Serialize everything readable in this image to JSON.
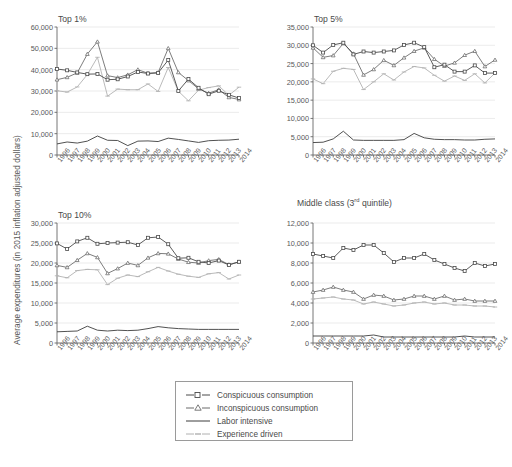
{
  "figure": {
    "ylabel": "Average expenditures (in 2015 inflation adjusted dollars)",
    "background": "#ffffff",
    "axis_color": "#666666",
    "grid_color": "#e3e3e3"
  },
  "legend": {
    "position": "bottom-center",
    "items": [
      {
        "label": "Conspicuous consumption",
        "marker": "square",
        "color": "#4a4a4a"
      },
      {
        "label": "Inconspicuous consumption",
        "marker": "triangle",
        "color": "#6b6b6b"
      },
      {
        "label": "Labor intensive",
        "marker": "line",
        "color": "#3d3d3d"
      },
      {
        "label": "Experience driven",
        "marker": "dot",
        "color": "#b0b0b0"
      }
    ]
  },
  "chart_data": [
    {
      "type": "line",
      "title": "Top 1%",
      "xlabel": "",
      "ylabel": "Average expenditures (in 2015 inflation adjusted dollars)",
      "x": [
        1996,
        1997,
        1998,
        1999,
        2000,
        2001,
        2002,
        2003,
        2004,
        2005,
        2006,
        2007,
        2008,
        2009,
        2010,
        2011,
        2012,
        2013,
        2014
      ],
      "ylim": [
        0,
        60000
      ],
      "yticks": [
        "0",
        "10,000",
        "20,000",
        "30,000",
        "40,000",
        "50,000",
        "60,000"
      ],
      "grid": true,
      "series": [
        {
          "name": "Conspicuous consumption",
          "marker": "square",
          "values": [
            40300,
            39700,
            38700,
            37900,
            38000,
            35300,
            35500,
            36800,
            38900,
            38200,
            38500,
            44500,
            30000,
            35600,
            31500,
            28500,
            30100,
            28200,
            26700
          ]
        },
        {
          "name": "Inconspicuous consumption",
          "marker": "triangle",
          "values": [
            35300,
            36400,
            38500,
            47300,
            53100,
            37200,
            36300,
            37600,
            40000,
            38300,
            38600,
            50000,
            38700,
            34900,
            31000,
            29000,
            30600,
            27000,
            26000
          ]
        },
        {
          "name": "Labor intensive",
          "marker": "line",
          "values": [
            5200,
            6100,
            5600,
            6500,
            8900,
            6900,
            6800,
            4400,
            6500,
            6600,
            6300,
            7900,
            7300,
            6600,
            5900,
            6700,
            6900,
            7000,
            7400
          ]
        },
        {
          "name": "Experience driven",
          "marker": "dot",
          "values": [
            30100,
            29500,
            31900,
            37700,
            45800,
            27600,
            30900,
            30600,
            30600,
            33300,
            29800,
            41000,
            29900,
            25400,
            30400,
            31600,
            32400,
            28000,
            31800
          ]
        }
      ]
    },
    {
      "type": "line",
      "title": "Top 5%",
      "xlabel": "",
      "ylabel": "Average expenditures (in 2015 inflation adjusted dollars)",
      "x": [
        1996,
        1997,
        1998,
        1999,
        2000,
        2001,
        2002,
        2003,
        2004,
        2005,
        2006,
        2007,
        2008,
        2009,
        2010,
        2011,
        2012,
        2013,
        2014
      ],
      "ylim": [
        0,
        35000
      ],
      "yticks": [
        "0",
        "5,000",
        "10,000",
        "15,000",
        "20,000",
        "25,000",
        "30,000",
        "35,000"
      ],
      "grid": true,
      "series": [
        {
          "name": "Conspicuous consumption",
          "marker": "square",
          "values": [
            30000,
            28000,
            30100,
            30700,
            27500,
            28300,
            28000,
            28300,
            28600,
            30100,
            30700,
            29500,
            24000,
            24700,
            22800,
            22800,
            24500,
            22400,
            22400
          ]
        },
        {
          "name": "Inconspicuous consumption",
          "marker": "triangle",
          "values": [
            29300,
            26700,
            27200,
            30500,
            27700,
            21900,
            23400,
            25900,
            24500,
            26600,
            28400,
            29300,
            26200,
            24300,
            25200,
            27300,
            28400,
            24200,
            26000
          ]
        },
        {
          "name": "Labor intensive",
          "marker": "line",
          "values": [
            3400,
            3500,
            4400,
            6500,
            4100,
            4000,
            4000,
            4000,
            4000,
            4200,
            5900,
            4700,
            4300,
            4200,
            4200,
            4100,
            4100,
            4300,
            4400
          ]
        },
        {
          "name": "Experience driven",
          "marker": "dot",
          "values": [
            20800,
            19500,
            22900,
            23700,
            23400,
            17900,
            20000,
            22200,
            20500,
            22700,
            24200,
            23800,
            21800,
            20200,
            21600,
            20400,
            22200,
            19700,
            22400
          ]
        }
      ]
    },
    {
      "type": "line",
      "title": "Top 10%",
      "xlabel": "",
      "ylabel": "Average expenditures (in 2015 inflation adjusted dollars)",
      "x": [
        1996,
        1997,
        1998,
        1999,
        2000,
        2001,
        2002,
        2003,
        2004,
        2005,
        2006,
        2007,
        2008,
        2009,
        2010,
        2011,
        2012,
        2013,
        2014
      ],
      "ylim": [
        0,
        30000
      ],
      "yticks": [
        "0",
        "5,000",
        "10,000",
        "15,000",
        "20,000",
        "25,000",
        "30,000"
      ],
      "grid": true,
      "series": [
        {
          "name": "Conspicuous consumption",
          "marker": "square",
          "values": [
            24900,
            23500,
            25400,
            26300,
            24800,
            25000,
            25100,
            25200,
            24500,
            26300,
            26500,
            24700,
            21200,
            21300,
            20300,
            20000,
            20600,
            19500,
            20300
          ]
        },
        {
          "name": "Inconspicuous consumption",
          "marker": "triangle",
          "values": [
            19400,
            18900,
            20700,
            22400,
            21400,
            17400,
            18600,
            20000,
            19400,
            21300,
            22400,
            22300,
            21000,
            20200,
            20000,
            20600,
            20900,
            19600,
            20300
          ]
        },
        {
          "name": "Labor intensive",
          "marker": "line",
          "values": [
            2800,
            2900,
            3000,
            4200,
            3200,
            3000,
            3200,
            3100,
            3200,
            3600,
            4100,
            3800,
            3600,
            3500,
            3400,
            3400,
            3400,
            3400,
            3400
          ]
        },
        {
          "name": "Experience driven",
          "marker": "dot",
          "values": [
            16800,
            16300,
            18100,
            18400,
            18300,
            14600,
            16200,
            17000,
            16600,
            17800,
            18900,
            18000,
            17200,
            16700,
            16400,
            17300,
            17600,
            16000,
            17000
          ]
        }
      ]
    },
    {
      "type": "line",
      "title": "Middle class (3rd quintile)",
      "title_sup": "rd",
      "xlabel": "",
      "ylabel": "Average expenditures (in 2015 inflation adjusted dollars)",
      "x": [
        1996,
        1997,
        1998,
        1999,
        2000,
        2001,
        2002,
        2003,
        2004,
        2005,
        2006,
        2007,
        2008,
        2009,
        2010,
        2011,
        2012,
        2013,
        2014
      ],
      "ylim": [
        0,
        12000
      ],
      "yticks": [
        "0",
        "2,000",
        "4,000",
        "6,000",
        "8,000",
        "10,000",
        "12,000"
      ],
      "grid": true,
      "series": [
        {
          "name": "Conspicuous consumption",
          "marker": "square",
          "values": [
            8900,
            8700,
            8500,
            9500,
            9300,
            9800,
            9800,
            9000,
            8100,
            8500,
            8500,
            8900,
            8300,
            7900,
            7500,
            7200,
            8000,
            7700,
            7900
          ]
        },
        {
          "name": "Inconspicuous consumption",
          "marker": "triangle",
          "values": [
            5100,
            5300,
            5600,
            5300,
            5100,
            4400,
            4800,
            4700,
            4300,
            4400,
            4700,
            4700,
            4400,
            4700,
            4300,
            4400,
            4200,
            4200,
            4200
          ]
        },
        {
          "name": "Labor intensive",
          "marker": "line",
          "values": [
            700,
            700,
            700,
            700,
            700,
            700,
            800,
            600,
            600,
            600,
            600,
            600,
            600,
            600,
            600,
            700,
            600,
            600,
            600
          ]
        },
        {
          "name": "Experience driven",
          "marker": "dot",
          "values": [
            4400,
            4500,
            4600,
            4400,
            4300,
            3900,
            4100,
            3900,
            3700,
            3800,
            4000,
            4100,
            3900,
            4000,
            3800,
            3800,
            3700,
            3700,
            3600
          ]
        }
      ]
    }
  ]
}
